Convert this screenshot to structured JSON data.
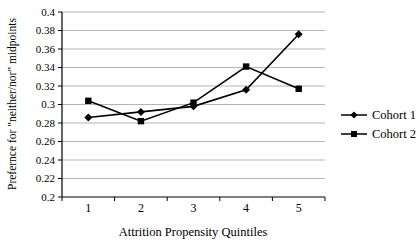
{
  "page": {
    "background": "#ffffff"
  },
  "chart_data": {
    "type": "line",
    "title": "",
    "xlabel": "Attrition Propensity Quintiles",
    "ylabel": "Prefernce for \"neither/nor\" midpoints",
    "x_categories": [
      "1",
      "2",
      "3",
      "4",
      "5"
    ],
    "ylim": [
      0.2,
      0.4
    ],
    "ytick_labels": [
      "0.4",
      "0.38",
      "0.36",
      "0.34",
      "0.32",
      "0.3",
      "0.28",
      "0.26",
      "0.24",
      "0.22",
      "0.2"
    ],
    "yticks": [
      0.4,
      0.38,
      0.36,
      0.34,
      0.32,
      0.3,
      0.28,
      0.26,
      0.24,
      0.22,
      0.2
    ],
    "grid": "horizontal",
    "legend_position": "right",
    "series": [
      {
        "name": "Cohort 1",
        "marker": "diamond",
        "color": "#000000",
        "values": [
          0.286,
          0.292,
          0.298,
          0.316,
          0.376
        ]
      },
      {
        "name": "Cohort 2",
        "marker": "square",
        "color": "#000000",
        "values": [
          0.304,
          0.282,
          0.302,
          0.341,
          0.317
        ]
      }
    ],
    "colors": {
      "axis": "#000000",
      "gridline": "#b5b5b5",
      "text": "#000000"
    }
  }
}
